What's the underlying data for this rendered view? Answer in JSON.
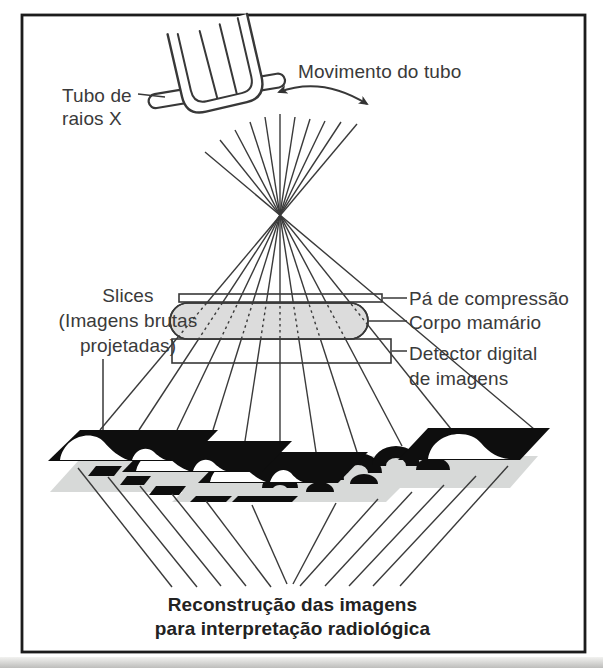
{
  "colors": {
    "ink": "#383838",
    "line": "#3a3a3a",
    "black": "#0e0e0e",
    "breast-gray": "#dcdcdc",
    "slice-gray": "#d7d9d8",
    "frame": "#1c1c1c",
    "text": "#3a3a3a",
    "caption-text": "#222222",
    "bg": "#ffffff"
  },
  "diagram": {
    "tube_label": {
      "line1": "Tubo de",
      "line2": "raios X"
    },
    "movement_label": "Movimento do tubo",
    "slices_label": {
      "line1": "Slices",
      "line2": "(Imagens brutas",
      "line3": "projetadas)"
    },
    "paddle_label": "Pá de compressão",
    "breast_label": "Corpo mamário",
    "detector_label": {
      "line1": "Detector digital",
      "line2": "de imagens"
    },
    "caption": {
      "line1": "Reconstrução das imagens",
      "line2": "para interpretação radiológica"
    }
  }
}
